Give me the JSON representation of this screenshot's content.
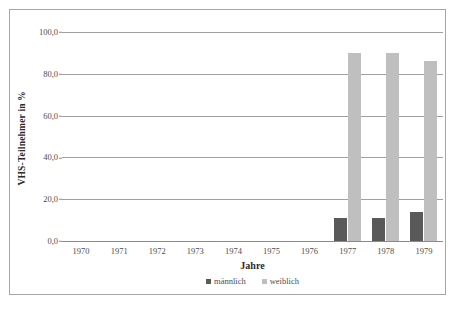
{
  "chart_data": {
    "type": "bar",
    "title": "",
    "subtitle": "",
    "xlabel": "Jahre",
    "ylabel": "VHS-Teilnehmer in %",
    "categories": [
      "1970",
      "1971",
      "1972",
      "1973",
      "1974",
      "1975",
      "1976",
      "1977",
      "1978",
      "1979"
    ],
    "series": [
      {
        "name": "männlich",
        "color": "#595959",
        "values": [
          null,
          null,
          null,
          null,
          null,
          null,
          null,
          11.0,
          11.0,
          14.0
        ]
      },
      {
        "name": "weiblich",
        "color": "#bfbfbf",
        "values": [
          null,
          null,
          null,
          null,
          null,
          null,
          null,
          90.0,
          90.0,
          86.0
        ]
      }
    ],
    "ylim": [
      0.0,
      100.0
    ],
    "ytick_values": [
      0.0,
      20.0,
      40.0,
      60.0,
      80.0,
      100.0
    ],
    "ytick_labels": [
      "0,0",
      "20,0",
      "40,0",
      "60,0",
      "80,0",
      "100,0"
    ],
    "grid": "horizontal",
    "legend_position": "bottom",
    "legend": [
      "männlich",
      "weiblich"
    ]
  },
  "axes": {
    "y_title": "VHS-Teilnehmer in %",
    "x_title": "Jahre"
  },
  "colors": {
    "male": "#595959",
    "female": "#bfbfbf",
    "gridline": "#a0a0a0",
    "frame": "#a6a6a6",
    "text": "#4d4d4d"
  }
}
